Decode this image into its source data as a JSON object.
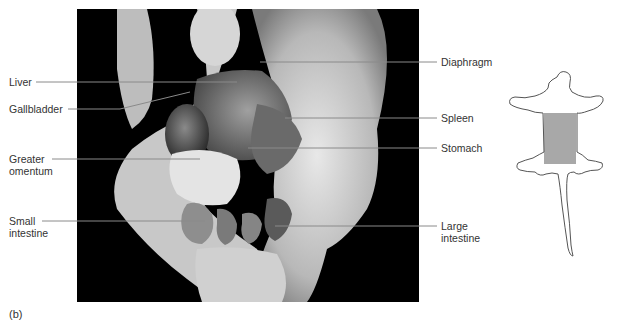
{
  "figure": {
    "caption": "(b)",
    "photo_description": "Ventral dissection of rat abdominal cavity (grayscale photograph)",
    "labels_left": [
      {
        "id": "liver",
        "line1": "Liver",
        "line2": ""
      },
      {
        "id": "gallbladder",
        "line1": "Gallbladder",
        "line2": ""
      },
      {
        "id": "greater-omentum",
        "line1": "Greater",
        "line2": "omentum"
      },
      {
        "id": "small-intestine",
        "line1": "Small",
        "line2": "intestine"
      }
    ],
    "labels_right": [
      {
        "id": "diaphragm",
        "line1": "Diaphragm",
        "line2": ""
      },
      {
        "id": "spleen",
        "line1": "Spleen",
        "line2": ""
      },
      {
        "id": "stomach",
        "line1": "Stomach",
        "line2": ""
      },
      {
        "id": "large-intestine",
        "line1": "Large",
        "line2": "intestine"
      }
    ],
    "orientation_icon": {
      "description": "Rat silhouette outline with shaded abdominal region",
      "highlight_color": "#a8a8a8",
      "outline_color": "#555555"
    },
    "colors": {
      "photo_background": "#000000",
      "leader_line": "#8a8a8a",
      "text": "#333333"
    }
  }
}
